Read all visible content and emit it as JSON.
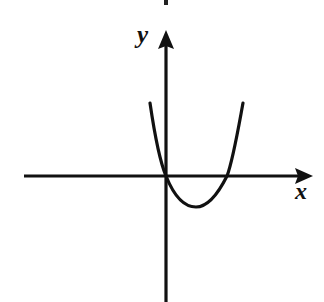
{
  "figure": {
    "kind": "coordinate-plane-parabola-sketch",
    "background_color": "#ffffff",
    "ink_color": "#111111",
    "width": 324,
    "height": 302
  },
  "axes": {
    "x_label": "x",
    "y_label": "y",
    "origin": {
      "x": 166,
      "y": 176
    },
    "x_axis": {
      "name": "x-axis",
      "start_x": 24,
      "end_x": 313,
      "y": 176,
      "has_arrowhead": true,
      "arrow_direction": "right"
    },
    "y_axis": {
      "name": "y-axis",
      "x": 166,
      "top_y": 30,
      "bottom_y": 302,
      "has_arrowhead": true,
      "arrow_direction": "up"
    },
    "tick_labels": [],
    "grid": false
  },
  "artifacts": {
    "top_speck": {
      "x": 166,
      "y": 2,
      "width": 4,
      "height": 5
    }
  },
  "chart_data": {
    "type": "line",
    "title": "",
    "subtitle": "",
    "xlabel": "x",
    "ylabel": "y",
    "grid": false,
    "legend_position": "none",
    "legend": [],
    "annotations": [],
    "curve_description": "Upward-opening parabola passing through the origin, dipping below the x-axis and returning to cross it again at a positive x value.",
    "roots_px": [
      {
        "x": 166,
        "y": 176
      },
      {
        "x": 227,
        "y": 176
      }
    ],
    "vertex_px": {
      "x": 196,
      "y": 207
    },
    "endpoints_px": [
      {
        "x": 150,
        "y": 103
      },
      {
        "x": 243,
        "y": 103
      }
    ],
    "series": [
      {
        "name": "parabola",
        "x": [
          150,
          155,
          160,
          166,
          172,
          178,
          184,
          190,
          196,
          202,
          208,
          214,
          220,
          227,
          233,
          238,
          243
        ],
        "y": [
          103,
          131,
          153,
          176,
          191,
          200,
          205,
          207,
          207,
          205,
          201,
          195,
          187,
          176,
          154,
          129,
          103
        ],
        "path_d": "M 150,103 C 155,137 160,162 166,176 C 174,196 184,207 196,207 C 208,207 218,194 227,176 C 233,160 238,130 243,103"
      }
    ],
    "xlim_px": [
      24,
      313
    ],
    "ylim_px": [
      30,
      302
    ]
  }
}
